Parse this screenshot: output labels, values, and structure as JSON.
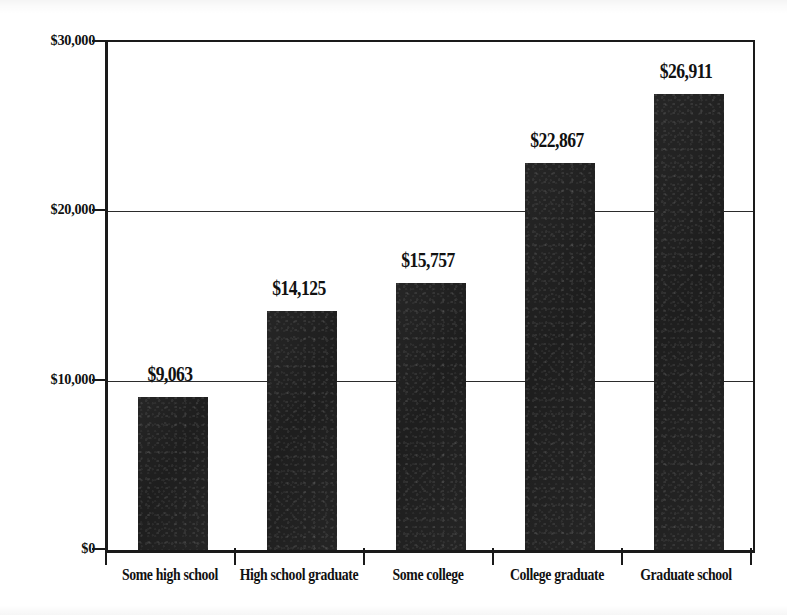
{
  "chart_data": {
    "type": "bar",
    "title": "",
    "subtitle": "",
    "xlabel": "",
    "ylabel": "",
    "categories": [
      "Some high school",
      "High school graduate",
      "Some college",
      "College graduate",
      "Graduate school"
    ],
    "values": [
      9063,
      14125,
      15757,
      22867,
      26911
    ],
    "value_labels": [
      "$9,063",
      "$14,125",
      "$15,757",
      "$22,867",
      "$26,911"
    ],
    "ylim": [
      0,
      30000
    ],
    "yticks": [
      0,
      10000,
      20000,
      30000
    ],
    "ytick_labels": [
      "$0",
      "$10,000",
      "$20,000",
      "$30,000"
    ],
    "grid": true,
    "grid_axis": "y",
    "legend": false,
    "legend_position": "none",
    "bar_color": "#1e1e1e",
    "axis_color": "#1a1a1a",
    "background_color": "#ffffff"
  }
}
